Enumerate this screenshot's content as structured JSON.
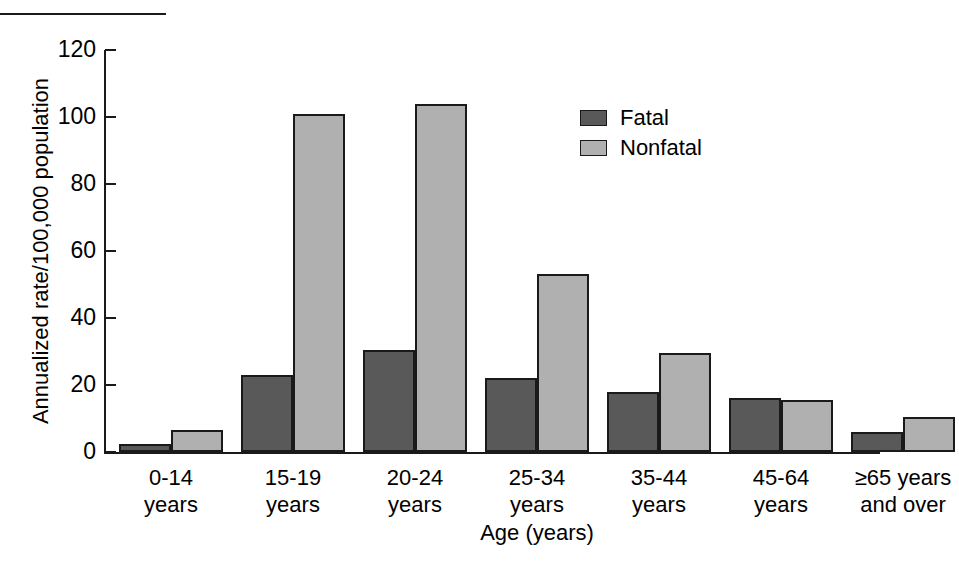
{
  "figure": {
    "top_rule": "horizontal-rule"
  },
  "chart_data": {
    "type": "bar",
    "title": "",
    "xlabel": "Age (years)",
    "ylabel": "Annualized rate/100,000 population",
    "ylim": [
      0,
      120
    ],
    "yticks": [
      0,
      20,
      40,
      60,
      80,
      100,
      120
    ],
    "ytick_labels": [
      "0",
      "20",
      "40",
      "60",
      "80",
      "100",
      "120"
    ],
    "grid": false,
    "legend_position": "upper right inside",
    "categories": [
      "0-14\nyears",
      "15-19\nyears",
      "20-24\nyears",
      "25-34\nyears",
      "35-44\nyears",
      "45-64\nyears",
      "≥65 years\nand over"
    ],
    "category_lines": [
      [
        "0-14",
        "years"
      ],
      [
        "15-19",
        "years"
      ],
      [
        "20-24",
        "years"
      ],
      [
        "25-34",
        "years"
      ],
      [
        "35-44",
        "years"
      ],
      [
        "45-64",
        "years"
      ],
      [
        "≥65 years",
        "and over"
      ]
    ],
    "series": [
      {
        "name": "Fatal",
        "color": "#595959",
        "values": [
          2.5,
          23,
          30.5,
          22,
          18,
          16,
          6
        ]
      },
      {
        "name": "Nonfatal",
        "color": "#b0b0b0",
        "values": [
          6.5,
          101,
          104,
          53,
          29.5,
          15.5,
          10.5
        ]
      }
    ]
  },
  "legend": {
    "items": [
      {
        "label": "Fatal",
        "color": "#595959"
      },
      {
        "label": "Nonfatal",
        "color": "#b0b0b0"
      }
    ]
  },
  "colors": {
    "fatal": "#595959",
    "nonfatal": "#b0b0b0",
    "axis": "#1a1a1a",
    "background": "#ffffff"
  }
}
